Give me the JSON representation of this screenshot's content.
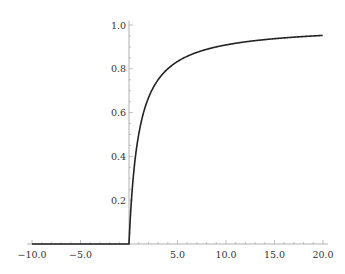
{
  "chart_data": {
    "type": "line",
    "title": "",
    "xlabel": "",
    "ylabel": "",
    "function_description": "f(x) = 0 for x <= 0, x/(x+1) for x > 0",
    "xlim": [
      -10.5,
      20.5
    ],
    "ylim": [
      0,
      1.02
    ],
    "x_ticks": [
      -10.0,
      -5.0,
      5.0,
      10.0,
      15.0,
      20.0
    ],
    "x_tick_labels": [
      "−10.0",
      "−5.0",
      "5.0",
      "10.0",
      "15.0",
      "20.0"
    ],
    "y_ticks": [
      0.2,
      0.4,
      0.6,
      0.8,
      1.0
    ],
    "y_tick_labels": [
      "0.2",
      "0.4",
      "0.6",
      "0.8",
      "1.0"
    ],
    "grid": false,
    "legend": null,
    "series": [
      {
        "name": "f(x)",
        "color": "#222222",
        "x": [
          -10,
          -5,
          0,
          0.25,
          0.5,
          1,
          1.5,
          2,
          3,
          4,
          5,
          6,
          8,
          10,
          12,
          15,
          18,
          20
        ],
        "y": [
          0,
          0,
          0,
          0.2,
          0.333,
          0.5,
          0.6,
          0.667,
          0.75,
          0.8,
          0.833,
          0.857,
          0.889,
          0.909,
          0.923,
          0.938,
          0.947,
          0.952
        ]
      }
    ]
  },
  "colors": {
    "axis": "#b0b0b0",
    "curve": "#222222",
    "text": "#333333"
  }
}
